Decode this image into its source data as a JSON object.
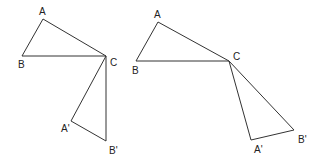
{
  "figures": [
    {
      "name": "left-rotation-figure",
      "points": {
        "A": [
          43,
          19
        ],
        "B": [
          22,
          56
        ],
        "C": [
          106,
          56
        ],
        "A2": [
          71,
          121
        ],
        "B2": [
          106,
          141
        ]
      },
      "labels": [
        {
          "text": "A",
          "x": 39,
          "y": 15
        },
        {
          "text": "B",
          "x": 18,
          "y": 68
        },
        {
          "text": "C",
          "x": 110,
          "y": 66
        },
        {
          "text": "A'",
          "x": 61,
          "y": 132
        },
        {
          "text": "B'",
          "x": 109,
          "y": 154
        }
      ]
    },
    {
      "name": "right-rotation-figure",
      "points": {
        "A": [
          158,
          22
        ],
        "B": [
          136,
          61
        ],
        "C": [
          229,
          61
        ],
        "A2": [
          251,
          140
        ],
        "B2": [
          294,
          130
        ]
      },
      "labels": [
        {
          "text": "A",
          "x": 154,
          "y": 18
        },
        {
          "text": "B",
          "x": 132,
          "y": 74
        },
        {
          "text": "C",
          "x": 233,
          "y": 60
        },
        {
          "text": "A'",
          "x": 254,
          "y": 153
        },
        {
          "text": "B'",
          "x": 298,
          "y": 143
        }
      ]
    }
  ]
}
